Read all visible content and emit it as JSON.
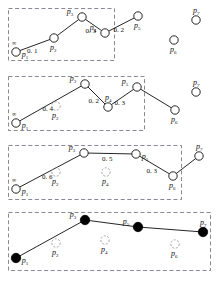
{
  "figure": {
    "width": 222,
    "height": 281,
    "background": "#ffffff",
    "stroke_color": "#1a1a1a",
    "dash_box_color": "#7a7a8c",
    "node_fill_hollow": "#ffffff",
    "node_fill_solid": "#000000",
    "ghost_node_color": "#9a9a9a",
    "infinity_symbol": "∞"
  },
  "chart_data": {
    "type": "diagram",
    "title": "",
    "node_ids": [
      "p1",
      "p2",
      "p3",
      "p4",
      "p5",
      "p6",
      "p7"
    ],
    "stages": [
      {
        "stage": 1,
        "box": {
          "x": 8,
          "y": 8,
          "w": 106,
          "h": 52
        },
        "nodes": [
          {
            "id": "p1",
            "label": "p",
            "sub": "1",
            "x": 16,
            "y": 52,
            "style": "hollow",
            "label_pos": "right",
            "cost": "∞"
          },
          {
            "id": "p2",
            "label": "p",
            "sub": "2",
            "x": 54,
            "y": 38,
            "style": "hollow",
            "label_pos": "below"
          },
          {
            "id": "p3",
            "label": "p",
            "sub": "3",
            "x": 82,
            "y": 17,
            "style": "hollow",
            "label_pos": "left"
          },
          {
            "id": "p4",
            "label": "p",
            "sub": "4",
            "x": 105,
            "y": 33,
            "style": "hollow",
            "label_pos": "left"
          },
          {
            "id": "p5",
            "label": "p",
            "sub": "5",
            "x": 138,
            "y": 16,
            "style": "hollow",
            "label_pos": "below"
          },
          {
            "id": "p6",
            "label": "p",
            "sub": "6",
            "x": 174,
            "y": 40,
            "style": "hollow",
            "label_pos": "below"
          },
          {
            "id": "p7",
            "label": "p",
            "sub": "7",
            "x": 196,
            "y": 20,
            "style": "hollow",
            "label_pos": "above"
          }
        ],
        "edges": [
          {
            "from": "p1",
            "to": "p2",
            "weight": "0. 1"
          },
          {
            "from": "p2",
            "to": "p3",
            "weight": ""
          },
          {
            "from": "p3",
            "to": "p4",
            "weight": "0. 3"
          },
          {
            "from": "p4",
            "to": "p5",
            "weight": "0. 2"
          }
        ]
      },
      {
        "stage": 2,
        "box": {
          "x": 8,
          "y": 76,
          "w": 136,
          "h": 54
        },
        "nodes": [
          {
            "id": "p1",
            "label": "p",
            "sub": "1",
            "x": 16,
            "y": 123,
            "style": "hollow",
            "label_pos": "right",
            "cost": "∞"
          },
          {
            "id": "p2",
            "label": "p",
            "sub": "2",
            "x": 56,
            "y": 106,
            "style": "ghost",
            "label_pos": "below"
          },
          {
            "id": "p3",
            "label": "p",
            "sub": "3",
            "x": 85,
            "y": 84,
            "style": "hollow",
            "label_pos": "left"
          },
          {
            "id": "p4",
            "label": "p",
            "sub": "4",
            "x": 108,
            "y": 107,
            "style": "hollow",
            "label_pos": "above"
          },
          {
            "id": "p5",
            "label": "p",
            "sub": "5",
            "x": 137,
            "y": 87,
            "style": "hollow",
            "label_pos": "left"
          },
          {
            "id": "p6",
            "label": "p",
            "sub": "6",
            "x": 175,
            "y": 110,
            "style": "hollow",
            "label_pos": "below"
          },
          {
            "id": "p7",
            "label": "p",
            "sub": "7",
            "x": 196,
            "y": 92,
            "style": "hollow",
            "label_pos": "above"
          }
        ],
        "edges": [
          {
            "from": "p1",
            "to": "p3",
            "weight": "0. 4"
          },
          {
            "from": "p3",
            "to": "p4",
            "weight": "0. 2"
          },
          {
            "from": "p4",
            "to": "p5",
            "weight": "0. 3"
          },
          {
            "from": "p5",
            "to": "p6",
            "weight": ""
          }
        ]
      },
      {
        "stage": 3,
        "box": {
          "x": 8,
          "y": 145,
          "w": 173,
          "h": 54
        },
        "nodes": [
          {
            "id": "p1",
            "label": "p",
            "sub": "1",
            "x": 16,
            "y": 189,
            "style": "hollow",
            "label_pos": "right",
            "cost": "∞"
          },
          {
            "id": "p2",
            "label": "p",
            "sub": "2",
            "x": 56,
            "y": 172,
            "style": "ghost",
            "label_pos": "below"
          },
          {
            "id": "p3",
            "label": "p",
            "sub": "3",
            "x": 84,
            "y": 153,
            "style": "hollow",
            "label_pos": "left"
          },
          {
            "id": "p4",
            "label": "p",
            "sub": "4",
            "x": 106,
            "y": 172,
            "style": "ghost",
            "label_pos": "below"
          },
          {
            "id": "p5",
            "label": "p",
            "sub": "5",
            "x": 136,
            "y": 154,
            "style": "hollow",
            "label_pos": "right"
          },
          {
            "id": "p6",
            "label": "p",
            "sub": "6",
            "x": 173,
            "y": 176,
            "style": "hollow",
            "label_pos": "below"
          },
          {
            "id": "p7",
            "label": "p",
            "sub": "7",
            "x": 199,
            "y": 156,
            "style": "hollow",
            "label_pos": "above"
          }
        ],
        "edges": [
          {
            "from": "p1",
            "to": "p3",
            "weight": "0. 6"
          },
          {
            "from": "p3",
            "to": "p5",
            "weight": "0. 5"
          },
          {
            "from": "p5",
            "to": "p6",
            "weight": "0. 3"
          },
          {
            "from": "p6",
            "to": "p7",
            "weight": ""
          }
        ]
      },
      {
        "stage": 4,
        "box": {
          "x": 8,
          "y": 212,
          "w": 202,
          "h": 58
        },
        "nodes": [
          {
            "id": "p1",
            "label": "p",
            "sub": "1",
            "x": 16,
            "y": 258,
            "style": "solid",
            "label_pos": "right"
          },
          {
            "id": "p2",
            "label": "p",
            "sub": "2",
            "x": 56,
            "y": 243,
            "style": "ghost",
            "label_pos": "below"
          },
          {
            "id": "p3",
            "label": "p",
            "sub": "3",
            "x": 85,
            "y": 220,
            "style": "solid",
            "label_pos": "left"
          },
          {
            "id": "p4",
            "label": "p",
            "sub": "4",
            "x": 105,
            "y": 240,
            "style": "ghost",
            "label_pos": "below"
          },
          {
            "id": "p5",
            "label": "p",
            "sub": "5",
            "x": 138,
            "y": 227,
            "style": "solid",
            "label_pos": "left"
          },
          {
            "id": "p6",
            "label": "p",
            "sub": "6",
            "x": 175,
            "y": 244,
            "style": "ghost",
            "label_pos": "below"
          },
          {
            "id": "p7",
            "label": "p",
            "sub": "7",
            "x": 203,
            "y": 232,
            "style": "solid",
            "label_pos": "above"
          }
        ],
        "edges": [
          {
            "from": "p1",
            "to": "p3",
            "weight": ""
          },
          {
            "from": "p3",
            "to": "p5",
            "weight": ""
          },
          {
            "from": "p5",
            "to": "p7",
            "weight": ""
          }
        ]
      }
    ],
    "weight_labels": [
      "0. 1",
      "0. 3",
      "0. 2",
      "0. 4",
      "0. 2",
      "0. 3",
      "0. 6",
      "0. 5",
      "0. 3"
    ]
  }
}
